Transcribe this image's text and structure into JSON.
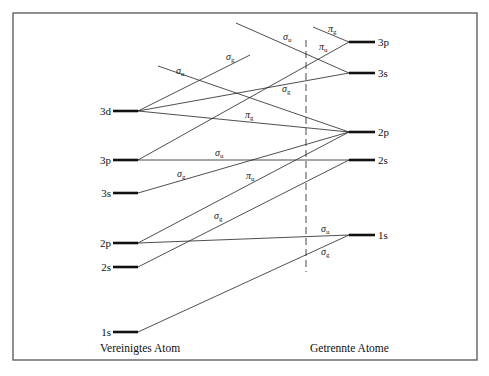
{
  "footer": {
    "left": "Vereinigtes Atom",
    "right": "Getrennte Atome"
  },
  "frame": {
    "x": 13,
    "y": 13,
    "w": 464,
    "h": 347
  },
  "divider": {
    "x": 306,
    "y1": 40,
    "y2": 272
  },
  "left_levels": [
    {
      "id": "3d",
      "label": "3d",
      "y": 111
    },
    {
      "id": "3p",
      "label": "3p",
      "y": 160
    },
    {
      "id": "3s",
      "label": "3s",
      "y": 193
    },
    {
      "id": "2p",
      "label": "2p",
      "y": 243
    },
    {
      "id": "2s",
      "label": "2s",
      "y": 267
    },
    {
      "id": "1s",
      "label": "1s",
      "y": 332
    }
  ],
  "right_levels": [
    {
      "id": "3p",
      "label": "3p",
      "y": 42
    },
    {
      "id": "3s",
      "label": "3s",
      "y": 73
    },
    {
      "id": "2p",
      "label": "2p",
      "y": 132
    },
    {
      "id": "2s",
      "label": "2s",
      "y": 160
    },
    {
      "id": "1s",
      "label": "1s",
      "y": 235
    }
  ],
  "left_x": [
    113,
    138
  ],
  "right_x": [
    349,
    375
  ],
  "connections": [
    {
      "from": [
        138,
        111
      ],
      "to": [
        250,
        55
      ],
      "sym": "σ",
      "sub": "g",
      "lx": 226,
      "ly": 60
    },
    {
      "from": [
        138,
        111
      ],
      "to": [
        349,
        73
      ],
      "sym": "σ",
      "sub": "g",
      "lx": 282,
      "ly": 92
    },
    {
      "from": [
        138,
        111
      ],
      "to": [
        349,
        132
      ],
      "sym": "π",
      "sub": "g",
      "lx": 245,
      "ly": 118
    },
    {
      "from": [
        158,
        66
      ],
      "to": [
        349,
        132
      ],
      "sym": "σ",
      "sub": "u",
      "lx": 176,
      "ly": 74
    },
    {
      "from": [
        236,
        23
      ],
      "to": [
        349,
        73
      ],
      "sym": "σ",
      "sub": "u",
      "lx": 283,
      "ly": 40
    },
    {
      "from": [
        313,
        27
      ],
      "to": [
        349,
        42
      ],
      "sym": "π",
      "sub": "g",
      "lx": 328,
      "ly": 32
    },
    {
      "from": [
        138,
        160
      ],
      "to": [
        349,
        42
      ],
      "sym": "π",
      "sub": "u",
      "lx": 319,
      "ly": 50
    },
    {
      "from": [
        138,
        160
      ],
      "to": [
        349,
        160
      ],
      "sym": "σ",
      "sub": "u",
      "lx": 215,
      "ly": 156
    },
    {
      "from": [
        138,
        193
      ],
      "to": [
        349,
        132
      ],
      "sym": "σ",
      "sub": "g",
      "lx": 177,
      "ly": 177
    },
    {
      "from": [
        138,
        243
      ],
      "to": [
        349,
        132
      ],
      "sym": "π",
      "sub": "u",
      "lx": 246,
      "ly": 179
    },
    {
      "from": [
        138,
        243
      ],
      "to": [
        349,
        235
      ],
      "sym": "σ",
      "sub": "u",
      "lx": 321,
      "ly": 232
    },
    {
      "from": [
        138,
        267
      ],
      "to": [
        349,
        160
      ],
      "sym": "σ",
      "sub": "g",
      "lx": 214,
      "ly": 219
    },
    {
      "from": [
        138,
        332
      ],
      "to": [
        349,
        235
      ],
      "sym": "σ",
      "sub": "g",
      "lx": 321,
      "ly": 255
    }
  ]
}
